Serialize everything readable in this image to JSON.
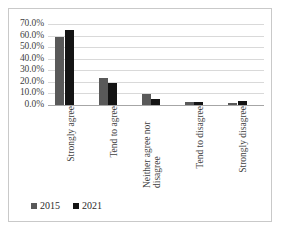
{
  "chart_data": {
    "type": "bar",
    "title": "",
    "subtitle": "",
    "xlabel": "",
    "ylabel": "",
    "ylim": [
      0,
      70
    ],
    "y_tick_step": 10,
    "y_tick_labels": [
      "0.0%",
      "10.0%",
      "20.0%",
      "30.0%",
      "40.0%",
      "50.0%",
      "60.0%",
      "70.0%"
    ],
    "y_tick_values": [
      0,
      10,
      20,
      30,
      40,
      50,
      60,
      70
    ],
    "grid": true,
    "grid_axis": "y",
    "legend_position": "bottom-left",
    "categories": [
      "Strongly agree",
      "Tend to agree",
      "Neither agree nor disagree",
      "Tend to disagree",
      "Strongly disagree"
    ],
    "category_lines": [
      [
        "Strongly agree"
      ],
      [
        "Tend to agree"
      ],
      [
        "Neither agree nor",
        "disagree"
      ],
      [
        "Tend to disagree"
      ],
      [
        "Strongly disagree"
      ]
    ],
    "series": [
      {
        "name": "2015",
        "color": "#595959",
        "values": [
          59.0,
          23.5,
          9.8,
          2.6,
          1.8
        ]
      },
      {
        "name": "2021",
        "color": "#141414",
        "values": [
          64.5,
          18.7,
          5.2,
          2.5,
          3.4
        ]
      }
    ]
  },
  "legend": {
    "items": [
      {
        "label": "2015",
        "color": "#595959"
      },
      {
        "label": "2021",
        "color": "#141414"
      }
    ]
  },
  "colors": {
    "series_2015": "#595959",
    "series_2021": "#141414",
    "gridline": "#d9d9d9",
    "axis": "#a6a6a6",
    "text": "#3f3f3f",
    "border": "#c9c9c9",
    "background": "#ffffff"
  }
}
